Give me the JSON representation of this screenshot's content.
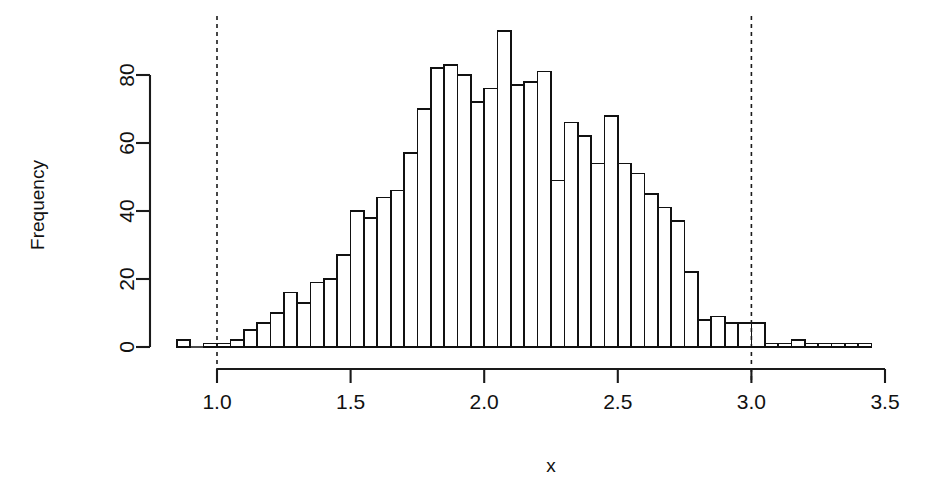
{
  "chart_data": {
    "type": "bar",
    "title": "",
    "subtitle": "",
    "xlabel": "x",
    "ylabel": "Frequency",
    "xlim": [
      0.86,
      3.44
    ],
    "ylim": [
      0,
      93
    ],
    "xticks": [
      1.0,
      1.5,
      2.0,
      2.5,
      3.0,
      3.5
    ],
    "xticklabels": [
      "1.0",
      "1.5",
      "2.0",
      "2.5",
      "3.0",
      "3.5"
    ],
    "yticks": [
      0,
      20,
      40,
      60,
      80
    ],
    "yticklabels": [
      "0",
      "20",
      "40",
      "60",
      "80"
    ],
    "grid": false,
    "legend": null,
    "bin_width": 0.05,
    "bin_starts": [
      0.85,
      0.9,
      0.95,
      1.0,
      1.05,
      1.1,
      1.15,
      1.2,
      1.25,
      1.3,
      1.35,
      1.4,
      1.45,
      1.5,
      1.55,
      1.6,
      1.65,
      1.7,
      1.75,
      1.8,
      1.85,
      1.9,
      1.95,
      2.0,
      2.05,
      2.1,
      2.15,
      2.2,
      2.25,
      2.3,
      2.35,
      2.4,
      2.45,
      2.5,
      2.55,
      2.6,
      2.65,
      2.7,
      2.75,
      2.8,
      2.85,
      2.9,
      2.95,
      3.0,
      3.05,
      3.1,
      3.15,
      3.2,
      3.25,
      3.3,
      3.35,
      3.4
    ],
    "categories": [
      "0.85-0.90",
      "0.90-0.95",
      "0.95-1.00",
      "1.00-1.05",
      "1.05-1.10",
      "1.10-1.15",
      "1.15-1.20",
      "1.20-1.25",
      "1.25-1.30",
      "1.30-1.35",
      "1.35-1.40",
      "1.40-1.45",
      "1.45-1.50",
      "1.50-1.55",
      "1.55-1.60",
      "1.60-1.65",
      "1.65-1.70",
      "1.70-1.75",
      "1.75-1.80",
      "1.80-1.85",
      "1.85-1.90",
      "1.90-1.95",
      "1.95-2.00",
      "2.00-2.05",
      "2.05-2.10",
      "2.10-2.15",
      "2.15-2.20",
      "2.20-2.25",
      "2.25-2.30",
      "2.30-2.35",
      "2.35-2.40",
      "2.40-2.45",
      "2.45-2.50",
      "2.50-2.55",
      "2.55-2.60",
      "2.60-2.65",
      "2.65-2.70",
      "2.70-2.75",
      "2.75-2.80",
      "2.80-2.85",
      "2.85-2.90",
      "2.90-2.95",
      "2.95-3.00",
      "3.00-3.05",
      "3.05-3.10",
      "3.10-3.15",
      "3.15-3.20",
      "3.20-3.25",
      "3.25-3.30",
      "3.30-3.35",
      "3.35-3.40",
      "3.40-3.45"
    ],
    "values": [
      2,
      0,
      1,
      1,
      2,
      5,
      7,
      10,
      16,
      13,
      19,
      20,
      27,
      40,
      38,
      44,
      46,
      57,
      70,
      82,
      83,
      80,
      72,
      76,
      93,
      77,
      78,
      81,
      49,
      66,
      62,
      54,
      68,
      54,
      51,
      45,
      41,
      37,
      22,
      8,
      9,
      7,
      7,
      7,
      1,
      1,
      2,
      1,
      1,
      1,
      1,
      1
    ],
    "annotations": [
      {
        "name": "vline-lower",
        "type": "vline",
        "x": 1.0,
        "style": "dashed"
      },
      {
        "name": "vline-upper",
        "type": "vline",
        "x": 3.0,
        "style": "dashed"
      }
    ],
    "colors": {
      "bar_fill": "#ffffff",
      "bar_stroke": "#111111",
      "axis": "#1a1a1a",
      "text": "#111111",
      "background": "#ffffff"
    }
  },
  "layout": {
    "plot_left_px": 150,
    "plot_baseline_px": 347,
    "axis_x_start_value": 1.0,
    "axis_x_end_value": 3.5,
    "axis_x_start_px": 217,
    "axis_x_end_px": 885,
    "y_axis_x_px": 150,
    "y_top_px": 75,
    "y_per_unit_px": 3.4,
    "xaxis_line_y_px": 369,
    "xtick_len_px": 14,
    "ytick_len_px": 14
  }
}
